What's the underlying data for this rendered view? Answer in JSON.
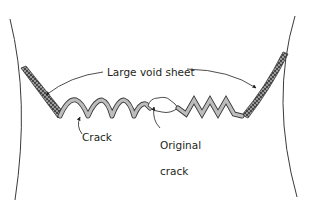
{
  "diagram": {
    "labels": {
      "large_void_sheet": "Large void sheet",
      "crack": "Crack",
      "original_crack_line1": "Original",
      "original_crack_line2": "crack"
    },
    "colors": {
      "line": "#3a3a3a",
      "crack_fill": "#bdbdbd",
      "void_fill": "#9a9a9a",
      "void_dots": "#1e1e1e",
      "text": "#231f20",
      "background": "#ffffff"
    }
  }
}
